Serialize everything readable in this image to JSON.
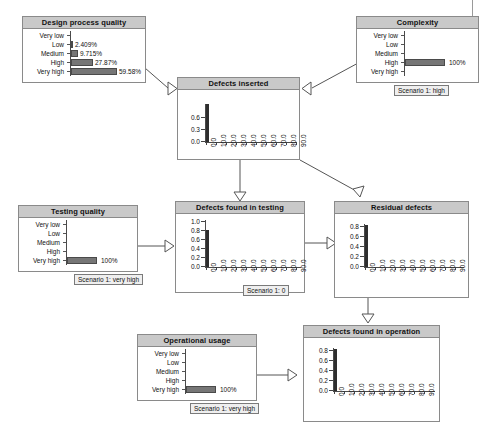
{
  "diagram": {
    "kind": "bayesian-network",
    "states": [
      "Very low",
      "Low",
      "Medium",
      "High",
      "Very high"
    ],
    "xaxis_ticks": [
      "0.0",
      "10.0",
      "20.0",
      "30.0",
      "40.0",
      "50.0",
      "60.0",
      "70.0",
      "80.0",
      "90.0"
    ],
    "colors": {
      "bar_fill": "#767676",
      "bar_stroke": "#4a4a4a",
      "title_bar": "#c9c9c9",
      "node_border": "#8a8a8a",
      "arc": "#555555",
      "spike": "#2e2e2e",
      "scenario_bg": "#efefef"
    }
  },
  "nodes": {
    "design_process_quality": {
      "title": "Design process quality",
      "type": "discrete",
      "states": [
        "Very low",
        "Low",
        "Medium",
        "High",
        "Very high"
      ],
      "values": [
        0.0,
        2.409,
        9.715,
        27.87,
        59.58
      ],
      "labels": [
        "",
        "2.409%",
        "9.715%",
        "27.87%",
        "59.58%"
      ],
      "scenario": null
    },
    "complexity": {
      "title": "Complexity",
      "type": "discrete",
      "states": [
        "Very low",
        "Low",
        "Medium",
        "High",
        "Very high"
      ],
      "values": [
        0,
        0,
        0,
        100,
        0
      ],
      "labels": [
        "",
        "",
        "",
        "100%",
        ""
      ],
      "scenario": "Scenario 1: high"
    },
    "testing_quality": {
      "title": "Testing quality",
      "type": "discrete",
      "states": [
        "Very low",
        "Low",
        "Medium",
        "High",
        "Very high"
      ],
      "values": [
        0,
        0,
        0,
        0,
        100
      ],
      "labels": [
        "",
        "",
        "",
        "",
        "100%"
      ],
      "scenario": "Scenario 1: very high"
    },
    "operational_usage": {
      "title": "Operational usage",
      "type": "discrete",
      "states": [
        "Very low",
        "Low",
        "Medium",
        "High",
        "Very high"
      ],
      "values": [
        0,
        0,
        0,
        0,
        100
      ],
      "labels": [
        "",
        "",
        "",
        "",
        "100%"
      ],
      "scenario": "Scenario 1: very high"
    },
    "defects_inserted": {
      "title": "Defects inserted",
      "type": "continuous",
      "yticks": [
        "0.6",
        "0.3",
        "0.0"
      ],
      "xticks": [
        "0.0",
        "10.0",
        "20.0",
        "30.0",
        "40.0",
        "50.0",
        "60.0",
        "70.0",
        "80.0",
        "90.0"
      ],
      "spike_at": "0.0",
      "spike_height": 0.75,
      "scenario": null
    },
    "defects_found_in_testing": {
      "title": "Defects found in testing",
      "type": "continuous",
      "yticks": [
        "1.0",
        "0.8",
        "0.6",
        "0.4",
        "0.2",
        "0.0"
      ],
      "xticks": [
        "0.0",
        "10.0",
        "20.0",
        "30.0",
        "40.0",
        "50.0",
        "60.0",
        "70.0",
        "80.0",
        "90.0"
      ],
      "spike_at": "0.0",
      "spike_height": 0.8,
      "scenario": "Scenario 1: 0"
    },
    "residual_defects": {
      "title": "Residual defects",
      "type": "continuous",
      "yticks": [
        "0.8",
        "0.6",
        "0.4",
        "0.2",
        "0.0"
      ],
      "xticks": [
        "0.0",
        "10.0",
        "20.0",
        "30.0",
        "40.0",
        "50.0",
        "60.0",
        "70.0",
        "80.0",
        "90.0"
      ],
      "spike_at": "0.0",
      "spike_height": 0.85,
      "scenario": null
    },
    "defects_found_in_operation": {
      "title": "Defects found in operation",
      "type": "continuous",
      "yticks": [
        "0.8",
        "0.6",
        "0.4",
        "0.2",
        "0.0"
      ],
      "xticks": [
        "0.0",
        "10.0",
        "20.0",
        "30.0",
        "40.0",
        "50.0",
        "60.0",
        "70.0",
        "80.0",
        "90.0"
      ],
      "spike_at": "0.0",
      "spike_height": 0.85,
      "scenario": null
    }
  },
  "edges": [
    {
      "from": "design_process_quality",
      "to": "defects_inserted"
    },
    {
      "from": "complexity",
      "to": "defects_inserted"
    },
    {
      "from": "defects_inserted",
      "to": "defects_found_in_testing"
    },
    {
      "from": "testing_quality",
      "to": "defects_found_in_testing"
    },
    {
      "from": "defects_inserted",
      "to": "residual_defects"
    },
    {
      "from": "defects_found_in_testing",
      "to": "residual_defects"
    },
    {
      "from": "residual_defects",
      "to": "defects_found_in_operation"
    },
    {
      "from": "operational_usage",
      "to": "defects_found_in_operation"
    }
  ],
  "caption": {
    "text": ""
  }
}
